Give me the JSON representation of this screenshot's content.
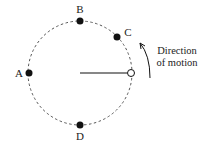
{
  "diagram": {
    "center": {
      "x": 80,
      "y": 73
    },
    "radius": 52,
    "path_style": "dashed",
    "points": [
      {
        "label": "A",
        "x": 28,
        "y": 73,
        "label_x": 19,
        "label_y": 77,
        "filled": true
      },
      {
        "label": "B",
        "x": 80,
        "y": 21,
        "label_x": 80,
        "label_y": 13,
        "filled": true
      },
      {
        "label": "C",
        "x": 117,
        "y": 36,
        "label_x": 127,
        "label_y": 35,
        "filled": true
      },
      {
        "label": "D",
        "x": 80,
        "y": 125,
        "label_x": 80,
        "label_y": 140,
        "filled": true
      }
    ],
    "object": {
      "x": 130,
      "y": 73,
      "filled": false
    },
    "radius_line": {
      "x1": 80,
      "y1": 73,
      "x2": 127,
      "y2": 73
    },
    "motion_caption": [
      "Direction",
      "of motion"
    ],
    "colors": {
      "ink": "#111111",
      "dash": "#555555",
      "background": "#ffffff"
    }
  }
}
